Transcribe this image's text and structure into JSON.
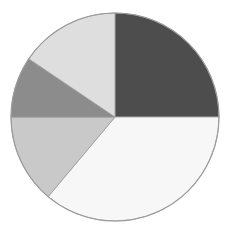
{
  "chart_data": {
    "type": "pie",
    "title": "",
    "xlabel": "",
    "ylabel": "",
    "legend_position": "none",
    "grid": false,
    "start_angle_deg": 0,
    "direction": "clockwise",
    "center": {
      "x": 115,
      "y": 117
    },
    "radius": 104,
    "outline_color": "#9a9a9a",
    "background_color": "#ffffff",
    "categories": [
      "Slice 1",
      "Slice 2",
      "Slice 3",
      "Slice 4",
      "Slice 5"
    ],
    "values": [
      25.0,
      36.1,
      13.9,
      9.4,
      15.6
    ],
    "angles_deg": [
      90,
      130,
      50,
      34,
      56
    ],
    "colors": [
      "#4d4d4d",
      "#f7f7f7",
      "#c9c9c9",
      "#8c8c8c",
      "#dedede"
    ],
    "slices": [
      {
        "label": "Slice 1",
        "value": 25.0,
        "angle_deg": 90,
        "start_deg": 0,
        "end_deg": 90,
        "color": "#4d4d4d"
      },
      {
        "label": "Slice 2",
        "value": 36.1,
        "angle_deg": 130,
        "start_deg": 90,
        "end_deg": 220,
        "color": "#f7f7f7"
      },
      {
        "label": "Slice 3",
        "value": 13.9,
        "angle_deg": 50,
        "start_deg": 220,
        "end_deg": 270,
        "color": "#c9c9c9"
      },
      {
        "label": "Slice 4",
        "value": 9.4,
        "angle_deg": 34,
        "start_deg": 270,
        "end_deg": 304,
        "color": "#8c8c8c"
      },
      {
        "label": "Slice 5",
        "value": 15.6,
        "angle_deg": 56,
        "start_deg": 304,
        "end_deg": 360,
        "color": "#dedede"
      }
    ]
  }
}
